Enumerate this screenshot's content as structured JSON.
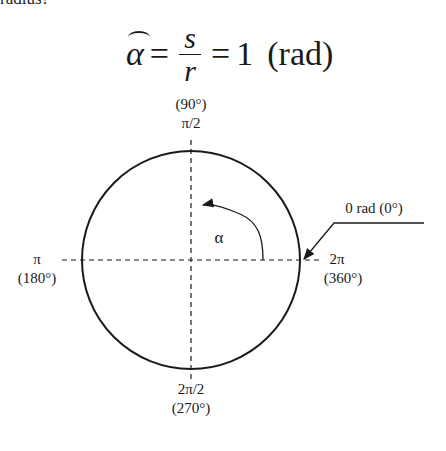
{
  "preceding_text_fragment": "radius?",
  "formula": {
    "lhs": "α",
    "equals": "=",
    "numerator": "s",
    "denominator": "r",
    "equals2": "=",
    "value": "1",
    "unit": "(rad)"
  },
  "diagram": {
    "type": "unit-circle-radian",
    "center": [
      191,
      260
    ],
    "radius": 109,
    "interior_angle_label": "α",
    "labels": {
      "top_deg": "(90°)",
      "top_rad": "π/2",
      "left_rad": "π",
      "left_deg": "(180°)",
      "right_rad": "2π",
      "right_deg": "(360°)",
      "bottom_rad": "2π/2",
      "bottom_deg": "(270°)",
      "zero_callout": "0 rad (0°)"
    },
    "colors": {
      "stroke": "#1a1a1a",
      "background": "#ffffff"
    }
  }
}
